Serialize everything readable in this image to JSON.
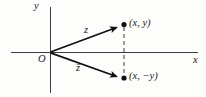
{
  "diagram": {
    "axes": {
      "x_label": "x",
      "y_label": "y",
      "origin_label": "O"
    },
    "vector": {
      "label": "z",
      "point_label": "(x, y)"
    },
    "conjugate": {
      "label": "z̄",
      "point_label": "(x, −y)"
    },
    "colors": {
      "axis": "#3d3d3d",
      "vector": "#111111",
      "dashed": "#3d3d3d",
      "text": "#1a1a1a"
    }
  }
}
